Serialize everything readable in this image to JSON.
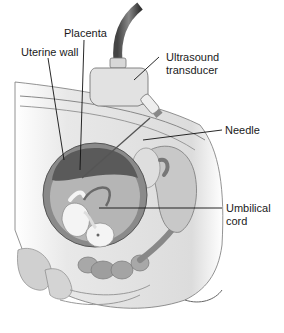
{
  "figure": {
    "labels": {
      "placenta": "Placenta",
      "uterine_wall": "Uterine wall",
      "ultrasound_line1": "Ultrasound",
      "ultrasound_line2": "transducer",
      "needle": "Needle",
      "umbilical_line1": "Umbilical",
      "umbilical_line2": "cord"
    },
    "colors": {
      "skin": "#e6e6e6",
      "uterus": "#8a8a8a",
      "placenta": "#5a5a5a",
      "amniotic": "#b5b5b5",
      "fetus": "#f4f4f4",
      "organ": "#9c9c9c",
      "outline": "#555555",
      "leader": "#111111"
    }
  }
}
